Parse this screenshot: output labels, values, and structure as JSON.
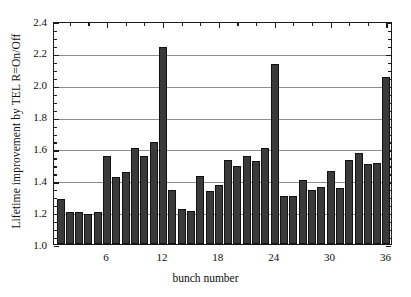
{
  "chart_data": {
    "type": "bar",
    "title": "",
    "xlabel": "bunch number",
    "ylabel": "Lifetime improvement by TEL R=On/Off",
    "xlim": [
      0.3,
      36.7
    ],
    "ylim": [
      1.0,
      2.4
    ],
    "ytick_labels": [
      "1.0",
      "1.2",
      "1.4",
      "1.6",
      "1.8",
      "2.0",
      "2.2",
      "2.4"
    ],
    "ytick_values": [
      1.0,
      1.2,
      1.4,
      1.6,
      1.8,
      2.0,
      2.2,
      2.4
    ],
    "ytick_minor_step": 0.05,
    "xtick_labels": [
      "6",
      "12",
      "18",
      "24",
      "30",
      "36"
    ],
    "xtick_values": [
      6,
      12,
      18,
      24,
      30,
      36
    ],
    "grid": "horizontal",
    "legend": "none",
    "bar_color": "#3a3a3a",
    "bar_edge_color": "#121212",
    "categories": [
      1,
      2,
      3,
      4,
      5,
      6,
      7,
      8,
      9,
      10,
      11,
      12,
      13,
      14,
      15,
      16,
      17,
      18,
      19,
      20,
      21,
      22,
      23,
      24,
      25,
      26,
      27,
      28,
      29,
      30,
      31,
      32,
      33,
      34,
      35,
      36
    ],
    "values": [
      1.28,
      1.2,
      1.2,
      1.19,
      1.2,
      1.55,
      1.42,
      1.45,
      1.6,
      1.55,
      1.64,
      2.24,
      1.34,
      1.22,
      1.21,
      1.43,
      1.33,
      1.37,
      1.53,
      1.49,
      1.55,
      1.52,
      1.6,
      2.13,
      1.3,
      1.3,
      1.4,
      1.34,
      1.36,
      1.46,
      1.35,
      1.53,
      1.57,
      1.5,
      1.51,
      2.05
    ]
  }
}
